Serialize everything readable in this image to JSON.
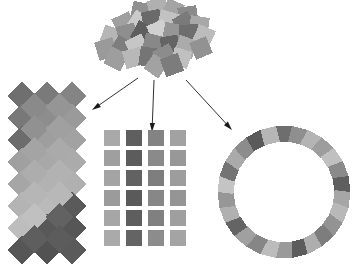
{
  "figure": {
    "background_color": "#ffffff",
    "width": 360,
    "height": 274,
    "palette": {
      "lightest": "#d4d4d4",
      "light": "#bdbdbd",
      "mid_light": "#a8a8a8",
      "mid": "#919191",
      "mid_dark": "#7d7d7d",
      "dark": "#686868",
      "darker": "#585858",
      "darkest": "#4a4a4a",
      "arrow_color": "#1a1a1a"
    }
  },
  "cluster": {
    "label": "disordered-square-cluster",
    "center_x": 162,
    "center_y": 42,
    "count": 31,
    "tile_size": 19,
    "squares": [
      {
        "x": 141,
        "y": 12,
        "size": 19,
        "rot": 12,
        "color": "#909090"
      },
      {
        "x": 158,
        "y": 8,
        "size": 19,
        "rot": -18,
        "color": "#b0b0b0"
      },
      {
        "x": 173,
        "y": 10,
        "size": 18,
        "rot": 22,
        "color": "#a4a4a4"
      },
      {
        "x": 188,
        "y": 16,
        "size": 19,
        "rot": -8,
        "color": "#8a8a8a"
      },
      {
        "x": 124,
        "y": 24,
        "size": 19,
        "rot": -25,
        "color": "#a0a0a0"
      },
      {
        "x": 139,
        "y": 22,
        "size": 18,
        "rot": 33,
        "color": "#cacaca"
      },
      {
        "x": 152,
        "y": 20,
        "size": 19,
        "rot": -12,
        "color": "#6a6a6a"
      },
      {
        "x": 168,
        "y": 21,
        "size": 19,
        "rot": 16,
        "color": "#c2c2c2"
      },
      {
        "x": 184,
        "y": 23,
        "size": 18,
        "rot": -30,
        "color": "#7a7a7a"
      },
      {
        "x": 199,
        "y": 26,
        "size": 19,
        "rot": 9,
        "color": "#a8a8a8"
      },
      {
        "x": 111,
        "y": 36,
        "size": 18,
        "rot": 20,
        "color": "#b6b6b6"
      },
      {
        "x": 127,
        "y": 34,
        "size": 19,
        "rot": -14,
        "color": "#8e8e8e"
      },
      {
        "x": 143,
        "y": 33,
        "size": 19,
        "rot": 28,
        "color": "#5e5e5e"
      },
      {
        "x": 158,
        "y": 31,
        "size": 18,
        "rot": -22,
        "color": "#d0d0d0"
      },
      {
        "x": 173,
        "y": 33,
        "size": 19,
        "rot": 11,
        "color": "#969696"
      },
      {
        "x": 189,
        "y": 34,
        "size": 19,
        "rot": -6,
        "color": "#6e6e6e"
      },
      {
        "x": 204,
        "y": 36,
        "size": 18,
        "rot": 24,
        "color": "#bcbcbc"
      },
      {
        "x": 106,
        "y": 49,
        "size": 19,
        "rot": -17,
        "color": "#9a9a9a"
      },
      {
        "x": 122,
        "y": 47,
        "size": 18,
        "rot": 31,
        "color": "#7e7e7e"
      },
      {
        "x": 137,
        "y": 46,
        "size": 19,
        "rot": -27,
        "color": "#c6c6c6"
      },
      {
        "x": 153,
        "y": 44,
        "size": 19,
        "rot": 14,
        "color": "#888888"
      },
      {
        "x": 170,
        "y": 45,
        "size": 18,
        "rot": -10,
        "color": "#646464"
      },
      {
        "x": 186,
        "y": 47,
        "size": 19,
        "rot": 19,
        "color": "#ababab"
      },
      {
        "x": 201,
        "y": 48,
        "size": 18,
        "rot": -23,
        "color": "#929292"
      },
      {
        "x": 116,
        "y": 59,
        "size": 19,
        "rot": 26,
        "color": "#9e9e9e"
      },
      {
        "x": 133,
        "y": 58,
        "size": 18,
        "rot": -15,
        "color": "#b8b8b8"
      },
      {
        "x": 149,
        "y": 57,
        "size": 19,
        "rot": 8,
        "color": "#757575"
      },
      {
        "x": 165,
        "y": 56,
        "size": 19,
        "rot": -29,
        "color": "#8c8c8c"
      },
      {
        "x": 181,
        "y": 58,
        "size": 18,
        "rot": 17,
        "color": "#c0c0c0"
      },
      {
        "x": 156,
        "y": 66,
        "size": 18,
        "rot": 35,
        "color": "#a2a2a2"
      },
      {
        "x": 172,
        "y": 65,
        "size": 19,
        "rot": -20,
        "color": "#7c7c7c"
      }
    ]
  },
  "arrows": [
    {
      "name": "arrow-to-diamond-lattice",
      "from_x": 138,
      "from_y": 78,
      "to_x": 92,
      "to_y": 110,
      "direction": "down-left"
    },
    {
      "name": "arrow-to-square-grid",
      "from_x": 154,
      "from_y": 80,
      "to_x": 152,
      "to_y": 132,
      "direction": "down"
    },
    {
      "name": "arrow-to-circular-ring",
      "from_x": 186,
      "from_y": 80,
      "to_x": 232,
      "to_y": 130,
      "direction": "down-right"
    }
  ],
  "arrangements": [
    {
      "name": "diamond-lattice",
      "label": "Diamond lattice arrangement",
      "shape": "diamond",
      "rotation_deg": 45,
      "columns": 3,
      "rows": 8,
      "tile_size": 20,
      "origin_x": 22,
      "origin_y": 96,
      "col_spacing": 25,
      "row_spacing": 22,
      "grid_colors": [
        [
          "#6f6f6f",
          "#7a7a7a",
          "#848484"
        ],
        [
          "#787878",
          "#8d8d8d",
          "#9a9a9a"
        ],
        [
          "#6c6c6c",
          "#9e9e9e",
          "#a2a2a2"
        ],
        [
          "#a0a0a0",
          "#a8a8a8",
          "#ababab"
        ],
        [
          "#a6a6a6",
          "#b2b2b2",
          "#b0b0b0"
        ],
        [
          "#b4b4b4",
          "#bababa",
          "#5a5a5a"
        ],
        [
          "#bdbdbd",
          "#585858",
          "#565656"
        ],
        [
          "#565656",
          "#525252",
          "#5a5a5a"
        ]
      ],
      "interstitial_colors": [
        [
          "#8a8a8a",
          "#959595"
        ],
        [
          "#919191",
          "#a0a0a0"
        ],
        [
          "#a4a4a4",
          "#aaaaaa"
        ],
        [
          "#adadad",
          "#b2b2b2"
        ],
        [
          "#b6b6b6",
          "#b8b8b8"
        ],
        [
          "#c0c0c0",
          "#626262"
        ],
        [
          "#5e5e5e",
          "#5c5c5c"
        ]
      ]
    },
    {
      "name": "square-grid",
      "label": "Rectangular grid arrangement",
      "shape": "square",
      "rotation_deg": 0,
      "columns": 4,
      "rows": 6,
      "tile_size": 16,
      "origin_x": 112,
      "origin_y": 138,
      "col_spacing": 22,
      "row_spacing": 20,
      "grid_colors": [
        [
          "#a9a9a9",
          "#5f5f5f",
          "#838383",
          "#a2a2a2"
        ],
        [
          "#9f9f9f",
          "#5c5c5c",
          "#8a8a8a",
          "#989898"
        ],
        [
          "#a4a4a4",
          "#626262",
          "#7e7e7e",
          "#9d9d9d"
        ],
        [
          "#9b9b9b",
          "#5a5a5a",
          "#878787",
          "#959595"
        ],
        [
          "#a6a6a6",
          "#5e5e5e",
          "#808080",
          "#9f9f9f"
        ],
        [
          "#aaaaaa",
          "#646464",
          "#8c8c8c",
          "#a4a4a4"
        ]
      ]
    },
    {
      "name": "circular-ring",
      "label": "Circular ring arrangement",
      "shape": "square",
      "count": 26,
      "tile_size": 16,
      "center_x": 284,
      "center_y": 192,
      "radius": 58,
      "start_angle_deg": -90,
      "ring_colors": [
        "#6e6e6e",
        "#8f8f8f",
        "#b4b4b4",
        "#9d9d9d",
        "#c0c0c0",
        "#8a8a8a",
        "#5f5f5f",
        "#a6a6a6",
        "#b8b8b8",
        "#939393",
        "#7d7d7d",
        "#aeaeae",
        "#5c5c5c",
        "#9a9a9a",
        "#bcbcbc",
        "#868686",
        "#a0a0a0",
        "#646464",
        "#b0b0b0",
        "#979797",
        "#c4c4c4",
        "#747474",
        "#aaaaaa",
        "#8c8c8c",
        "#5a5a5a",
        "#b6b6b6"
      ]
    }
  ]
}
